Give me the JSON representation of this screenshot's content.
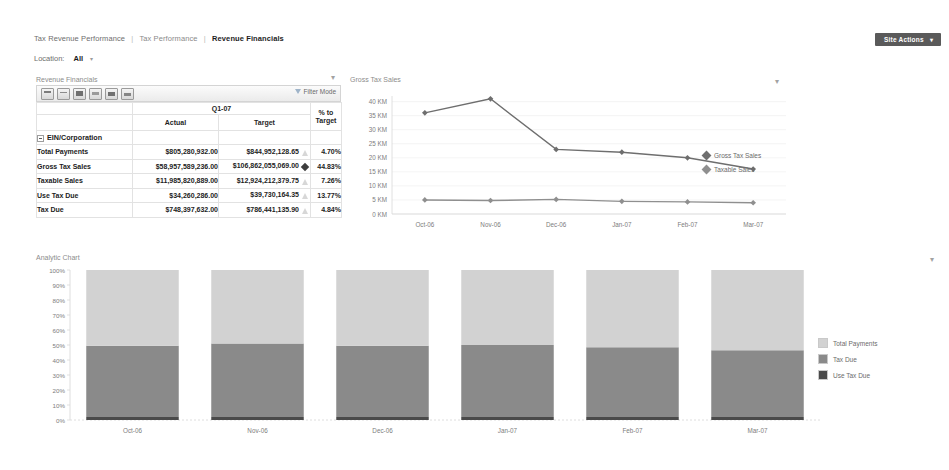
{
  "header": {
    "breadcrumb": [
      {
        "label": "Tax Revenue Performance",
        "current": false
      },
      {
        "label": "Tax Performance",
        "current": false
      },
      {
        "label": "Revenue Financials",
        "current": true
      }
    ],
    "separator": "|",
    "filter": {
      "label": "Location:",
      "value": "All",
      "caret": "▾"
    },
    "site_actions": {
      "label": "Site Actions",
      "caret": "▾",
      "color": "#5a5a5a"
    }
  },
  "scorecard": {
    "title": "Revenue Financials",
    "options_dot": "▾",
    "toolbar": {
      "icons": [
        "open-icon",
        "new-item-icon",
        "columns-icon",
        "export-icon",
        "chart-icon",
        "calendar-icon"
      ],
      "filter_mode_label": "Filter Mode"
    },
    "period_header": "Q1-07",
    "columns": [
      "",
      "Actual",
      "Target",
      "% to Target"
    ],
    "pct_header_line1": "% to",
    "pct_header_line2": "Target",
    "group_label": "EIN/Corporation",
    "rows": [
      {
        "name": "Total Payments",
        "actual": "$805,280,932.00",
        "target": "$844,952,128.65",
        "indicator": "triangle",
        "pct": "4.70%"
      },
      {
        "name": "Gross Tax Sales",
        "actual": "$58,957,589,236.00",
        "target": "$106,862,055,069.00",
        "indicator": "diamond",
        "pct": "44.83%"
      },
      {
        "name": "Taxable Sales",
        "actual": "$11,985,820,889.00",
        "target": "$12,924,212,379.75",
        "indicator": "triangle",
        "pct": "7.26%"
      },
      {
        "name": "Use Tax Due",
        "actual": "$34,260,286.00",
        "target": "$39,730,164.35",
        "indicator": "triangle",
        "pct": "13.77%"
      },
      {
        "name": "Tax Due",
        "actual": "$748,397,632.00",
        "target": "$786,441,135.90",
        "indicator": "triangle",
        "pct": "4.84%"
      }
    ]
  },
  "line_chart_title": "Gross Tax Sales",
  "line_chart_dot": "▾",
  "bar_chart_title": "Analytic Chart",
  "bar_chart_dot": "▾",
  "chart_data": [
    {
      "type": "line",
      "title": "Gross Tax Sales",
      "xlabel": "",
      "ylabel": "",
      "x": [
        "Oct-06",
        "Nov-06",
        "Dec-06",
        "Jan-07",
        "Feb-07",
        "Mar-07"
      ],
      "ylim": [
        0,
        42
      ],
      "yticks": [
        0,
        5,
        10,
        15,
        20,
        25,
        30,
        35,
        40
      ],
      "ytick_labels": [
        "0 KM",
        "5 KM",
        "10 KM",
        "15 KM",
        "20 KM",
        "25 KM",
        "30 KM",
        "35 KM",
        "40 KM"
      ],
      "grid": true,
      "legend_position": "right",
      "series": [
        {
          "name": "Gross Tax Sales",
          "color": "#6e6e6e",
          "values": [
            36.0,
            41.0,
            23.0,
            22.0,
            20.0,
            16.0
          ]
        },
        {
          "name": "Taxable Sales",
          "color": "#8f8f8f",
          "values": [
            5.0,
            4.8,
            5.2,
            4.5,
            4.3,
            4.0
          ]
        }
      ]
    },
    {
      "type": "bar",
      "subtype": "stacked-100",
      "title": "Analytic Chart",
      "xlabel": "",
      "ylabel": "",
      "categories": [
        "Oct-06",
        "Nov-06",
        "Dec-06",
        "Jan-07",
        "Feb-07",
        "Mar-07"
      ],
      "ylim": [
        0,
        100
      ],
      "yticks": [
        0,
        10,
        20,
        30,
        40,
        50,
        60,
        70,
        80,
        90,
        100
      ],
      "ytick_labels": [
        "0%",
        "10%",
        "20%",
        "30%",
        "40%",
        "50%",
        "60%",
        "70%",
        "80%",
        "90%",
        "100%"
      ],
      "grid": false,
      "legend_position": "right",
      "series": [
        {
          "name": "Total Payments",
          "color": "#d2d2d2",
          "values": [
            50.5,
            49.0,
            50.5,
            50.0,
            51.5,
            53.5
          ]
        },
        {
          "name": "Tax Due",
          "color": "#8a8a8a",
          "values": [
            47.5,
            49.0,
            47.5,
            48.0,
            46.5,
            44.5
          ]
        },
        {
          "name": "Use Tax Due",
          "color": "#4a4a4a",
          "values": [
            2.0,
            2.0,
            2.0,
            2.0,
            2.0,
            2.0
          ]
        }
      ]
    }
  ]
}
